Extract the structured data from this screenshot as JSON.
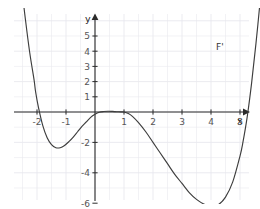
{
  "chart_data": {
    "type": "line",
    "title": "",
    "xlabel": "x",
    "ylabel": "y",
    "series_label": "F'",
    "grid": true,
    "legend_position": "top-right-inline",
    "xlim": [
      -2.85,
      5.8
    ],
    "ylim": [
      -7.2,
      6.3
    ],
    "xticks": [
      -2,
      -1,
      1,
      2,
      3,
      4,
      5
    ],
    "xtick_labels": [
      "-2",
      "-1",
      "1",
      "2",
      "3",
      "4",
      "5"
    ],
    "yticks": [
      -6,
      -4,
      -2,
      1,
      2,
      3,
      4,
      5
    ],
    "ytick_labels": [
      "-6",
      "-4",
      "-2",
      "1",
      "2",
      "3",
      "4",
      "5"
    ],
    "roots": [
      -2.05,
      1.0,
      5.1
    ],
    "local_minima": [
      [
        -1.2,
        -2.3
      ],
      [
        4.0,
        -6.2
      ]
    ],
    "local_maxima": [
      [
        1.0,
        0.0
      ]
    ],
    "x": [
      -2.85,
      -2.7,
      -2.55,
      -2.4,
      -2.25,
      -2.1,
      -2.05,
      -1.95,
      -1.8,
      -1.65,
      -1.5,
      -1.35,
      -1.2,
      -1.05,
      -0.9,
      -0.75,
      -0.6,
      -0.45,
      -0.3,
      -0.15,
      0,
      0.15,
      0.3,
      0.45,
      0.6,
      0.75,
      0.9,
      1,
      1.15,
      1.3,
      1.5,
      1.75,
      2,
      2.25,
      2.5,
      2.75,
      3,
      3.25,
      3.5,
      3.75,
      4,
      4.25,
      4.5,
      4.75,
      5,
      5.1,
      5.25,
      5.4,
      5.55,
      5.7,
      5.8
    ],
    "y": [
      15.1,
      11.6,
      8.6,
      6.1,
      3.9,
      2.1,
      1.35,
      0.3,
      -0.9,
      -1.7,
      -2.15,
      -2.35,
      -2.35,
      -2.2,
      -1.95,
      -1.65,
      -1.3,
      -0.95,
      -0.65,
      -0.35,
      -0.15,
      -0.02,
      0.03,
      0.05,
      0.04,
      0.02,
      0.005,
      0.0,
      -0.1,
      -0.3,
      -0.7,
      -1.3,
      -2.0,
      -2.7,
      -3.4,
      -4.1,
      -4.7,
      -5.3,
      -5.75,
      -6.05,
      -6.2,
      -6.1,
      -5.6,
      -4.6,
      -2.9,
      -2.0,
      -0.3,
      1.9,
      4.5,
      7.4,
      9.6
    ],
    "style": {
      "curve_color": "#3d3d3d",
      "axis_color": "#2b2b2b",
      "grid_color": "#e9e9ee",
      "background": "#ffffff",
      "label_color": "#555555"
    }
  },
  "labels": {
    "axis_x": "x",
    "axis_y": "y",
    "curve": "F'"
  }
}
